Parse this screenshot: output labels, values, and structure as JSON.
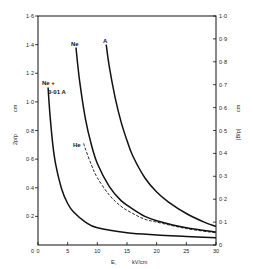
{
  "chart_data": {
    "type": "line",
    "title": "",
    "xlabel": "E,  kV/cm",
    "ylabel_left": "2p/p, cm",
    "ylabel_right": "|B/p|, cm",
    "xlim": [
      0,
      30
    ],
    "ylim_left": [
      0,
      1.6
    ],
    "ylim_right": [
      0,
      1.0
    ],
    "x_ticks": [
      "0",
      "5",
      "10",
      "15",
      "20",
      "25",
      "30"
    ],
    "y_ticks_left": [
      "0·2",
      "0·4",
      "0·6",
      "0·8",
      "1·0",
      "1·2",
      "1·4",
      "1·6"
    ],
    "y_ticks_right": [
      "0",
      "0·1",
      "0·2",
      "0·3",
      "0·4",
      "0·5",
      "0·6",
      "0·7",
      "0·8",
      "0·9",
      "1·0"
    ],
    "grid": false,
    "legend": "inline curve labels",
    "series": [
      {
        "name": "Ne + 0·01 A",
        "style": "solid",
        "x": [
          1.7,
          2.0,
          2.5,
          3,
          4,
          5,
          6,
          8,
          10,
          15,
          20,
          25,
          30
        ],
        "y": [
          1.1,
          0.92,
          0.7,
          0.56,
          0.39,
          0.29,
          0.23,
          0.16,
          0.12,
          0.085,
          0.07,
          0.06,
          0.05
        ]
      },
      {
        "name": "Ne",
        "style": "solid",
        "x": [
          6.4,
          7,
          8,
          9,
          10,
          12,
          14,
          16,
          18,
          20,
          25,
          30
        ],
        "y": [
          1.38,
          1.15,
          0.88,
          0.7,
          0.57,
          0.41,
          0.31,
          0.25,
          0.2,
          0.17,
          0.12,
          0.09
        ]
      },
      {
        "name": "He",
        "style": "dashed",
        "x": [
          7.7,
          8,
          9,
          10,
          12,
          14,
          16,
          18,
          20,
          25,
          30
        ],
        "y": [
          0.71,
          0.67,
          0.56,
          0.47,
          0.35,
          0.27,
          0.22,
          0.18,
          0.16,
          0.115,
          0.085
        ]
      },
      {
        "name": "A",
        "style": "solid",
        "x": [
          11.5,
          12,
          13,
          14,
          15,
          16,
          18,
          20,
          22,
          25,
          28,
          30
        ],
        "y": [
          1.4,
          1.25,
          1.03,
          0.86,
          0.73,
          0.62,
          0.47,
          0.37,
          0.3,
          0.22,
          0.16,
          0.13
        ]
      }
    ]
  },
  "labels": {
    "ne_plus": "Ne +",
    "ne_plus_sub": "0·01 A",
    "ne": "Ne",
    "he": "He",
    "a": "A",
    "xlabel_e": "E,",
    "xlabel_unit": "kV/cm",
    "left_axis_unit": "cm",
    "left_axis_fraction": "2p/p",
    "right_axis_unit": "cm",
    "right_axis_fraction": "|B/p|"
  }
}
